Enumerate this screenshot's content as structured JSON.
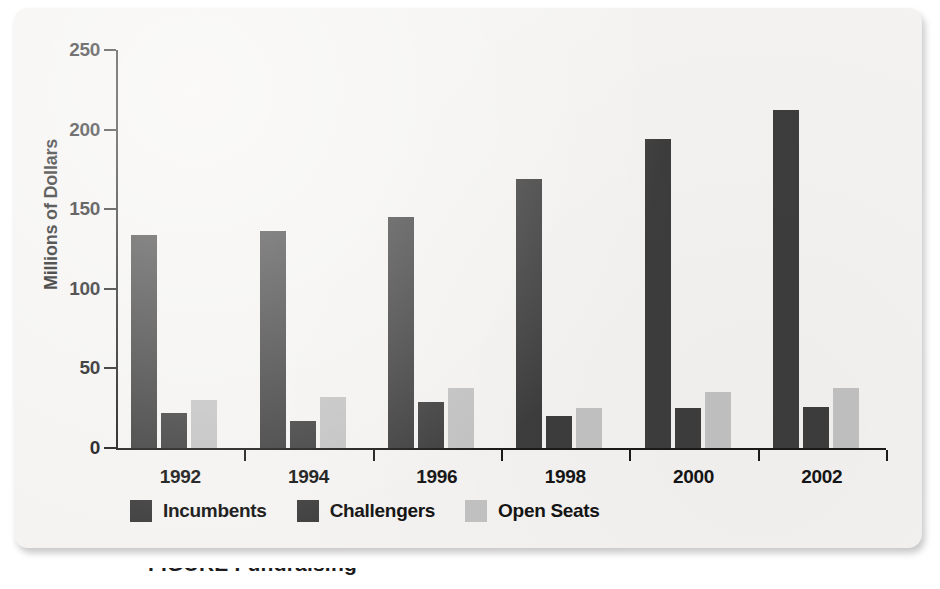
{
  "figure": {
    "caption_fragment": "FIGURE   Fundraising",
    "background_color": "#f4f3f1",
    "page_color": "#ffffff"
  },
  "chart_data": {
    "type": "bar",
    "title": "",
    "subtitle": "",
    "xlabel": "",
    "ylabel": "Millions of Dollars",
    "categories": [
      "1992",
      "1994",
      "1996",
      "1998",
      "2000",
      "2002"
    ],
    "series": [
      {
        "name": "Incumbents",
        "color": "#3d3d3d",
        "values": [
          134,
          136,
          145,
          169,
          194,
          212
        ]
      },
      {
        "name": "Challengers",
        "color": "#3d3d3d",
        "values": [
          22,
          17,
          29,
          20,
          25,
          26
        ]
      },
      {
        "name": "Open Seats",
        "color": "#c2c2c2",
        "values": [
          30,
          32,
          38,
          25,
          35,
          38
        ]
      }
    ],
    "ylim": [
      0,
      250
    ],
    "yticks": [
      "0",
      "50",
      "100",
      "150",
      "200",
      "250"
    ],
    "ytick_values": [
      0,
      50,
      100,
      150,
      200,
      250
    ],
    "grid": false,
    "legend_position": "bottom-left",
    "axis_color": "#1a1a1a"
  }
}
